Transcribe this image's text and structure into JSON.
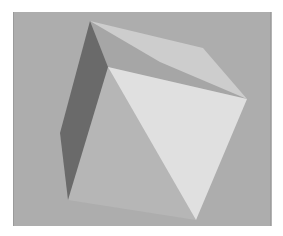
{
  "scene": {
    "description": "Rendered 3D polyhedron (tetrahedron-like solid) with flat grey shading on a grey background",
    "colors": {
      "page": "#ffffff",
      "background": "#adadad",
      "frame_edge": "#9a9a9a",
      "face_top_light": "#cdcdcd",
      "face_top_dark": "#a6a6a6",
      "face_dark_left": "#6a6a6a",
      "face_left_front": "#b6b6b6",
      "face_front_bright": "#e0e0e0"
    },
    "faces": [
      {
        "name": "top-light-face",
        "color_key": "face_top_light"
      },
      {
        "name": "top-dark-face",
        "color_key": "face_top_dark"
      },
      {
        "name": "dark-left-face",
        "color_key": "face_dark_left"
      },
      {
        "name": "left-front-face",
        "color_key": "face_left_front"
      },
      {
        "name": "bright-front-face",
        "color_key": "face_front_bright"
      }
    ]
  }
}
